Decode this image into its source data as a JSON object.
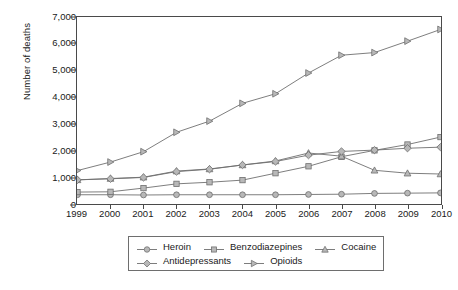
{
  "chart_data": {
    "type": "line",
    "title": "",
    "xlabel": "",
    "ylabel": "Number of deaths",
    "x": [
      1999,
      2000,
      2001,
      2002,
      2003,
      2004,
      2005,
      2006,
      2007,
      2008,
      2009,
      2010
    ],
    "xtick_labels": [
      "1999",
      "2000",
      "2001",
      "2002",
      "2003",
      "2004",
      "2005",
      "2006",
      "2007",
      "2008",
      "2009",
      "2010"
    ],
    "ytick_labels": [
      "0",
      "1,000",
      "2,000",
      "3,000",
      "4,000",
      "5,000",
      "6,000",
      "7,000"
    ],
    "yticks": [
      0,
      1000,
      2000,
      3000,
      4000,
      5000,
      6000,
      7000
    ],
    "ylim": [
      0,
      7000
    ],
    "grid": false,
    "legend_position": "below-center",
    "series": [
      {
        "name": "Heroin",
        "marker": "circle",
        "color": "#8c8c8c",
        "values": [
          330,
          330,
          320,
          330,
          330,
          330,
          330,
          340,
          350,
          380,
          390,
          400
        ]
      },
      {
        "name": "Benzodiazepines",
        "marker": "square",
        "color": "#8c8c8c",
        "values": [
          430,
          440,
          580,
          740,
          800,
          880,
          1140,
          1400,
          1760,
          2000,
          2220,
          2500
        ]
      },
      {
        "name": "Cocaine",
        "marker": "triangle",
        "color": "#8c8c8c",
        "values": [
          890,
          940,
          990,
          1220,
          1300,
          1450,
          1600,
          1900,
          1780,
          1250,
          1140,
          1110
        ]
      },
      {
        "name": "Antidepressants",
        "marker": "diamond",
        "color": "#8c8c8c",
        "values": [
          890,
          930,
          980,
          1200,
          1290,
          1450,
          1580,
          1820,
          1960,
          2010,
          2080,
          2120
        ]
      },
      {
        "name": "Opioids",
        "marker": "triangle-right",
        "color": "#8c8c8c",
        "values": [
          1240,
          1560,
          1950,
          2680,
          3100,
          3770,
          4130,
          4910,
          5580,
          5680,
          6110,
          6550
        ]
      }
    ]
  },
  "caption": {
    "text": ""
  }
}
